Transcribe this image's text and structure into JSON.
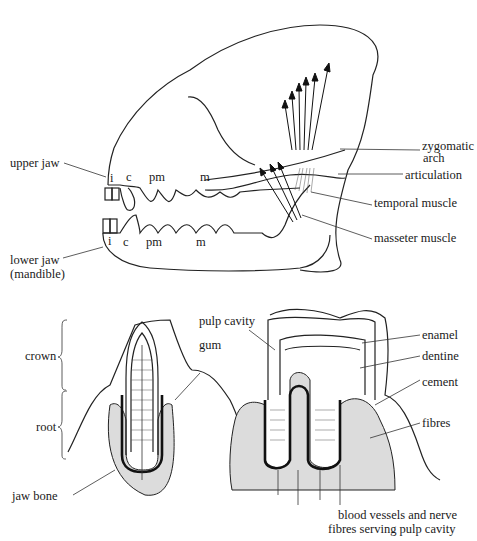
{
  "diagram": {
    "skull": {
      "labels": {
        "upper_jaw": "upper jaw",
        "lower_jaw_line1": "lower jaw",
        "lower_jaw_line2": "(mandible)",
        "zygomatic_line1": "zygomatic",
        "zygomatic_line2": "arch",
        "articulation": "articulation",
        "temporal_muscle": "temporal muscle",
        "masseter_muscle": "masseter muscle"
      },
      "upper_teeth": [
        "i",
        "c",
        "pm",
        "m"
      ],
      "lower_teeth": [
        "i",
        "c",
        "pm",
        "m"
      ]
    },
    "tooth_sections": {
      "labels": {
        "crown": "crown",
        "root": "root",
        "jaw_bone": "jaw bone",
        "gum": "gum",
        "pulp_cavity": "pulp cavity",
        "enamel": "enamel",
        "dentine": "dentine",
        "cement": "cement",
        "fibres": "fibres",
        "blood_line1": "blood vessels and nerve",
        "blood_line2": "fibres serving pulp cavity"
      }
    }
  }
}
